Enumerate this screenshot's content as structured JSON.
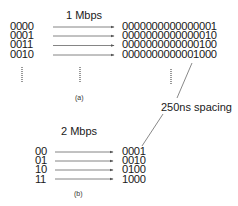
{
  "diagram": {
    "panel_a": {
      "rate_label": "1 Mbps",
      "caption": "(a)",
      "inputs": [
        "0000",
        "0001",
        "0011",
        "0010"
      ],
      "outputs": [
        "0000000000000001",
        "0000000000000010",
        "0000000000000100",
        "0000000000001000"
      ],
      "continuation": "⋮"
    },
    "panel_b": {
      "rate_label": "2 Mbps",
      "caption": "(b)",
      "inputs": [
        "00",
        "01",
        "10",
        "11"
      ],
      "outputs": [
        "0001",
        "0010",
        "0100",
        "1000"
      ]
    },
    "annotation": {
      "label": "250ns spacing"
    },
    "colors": {
      "text": "#1a1a1a",
      "arrow": "#555555",
      "background": "#ffffff"
    }
  }
}
